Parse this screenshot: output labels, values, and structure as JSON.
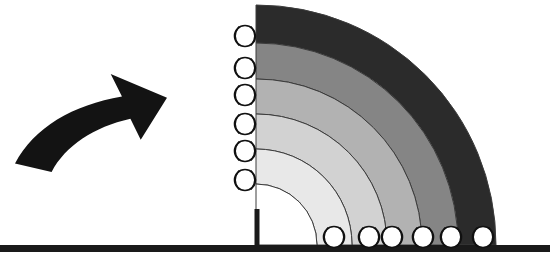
{
  "figure": {
    "title": "Baseball Range Fan Diagram",
    "background_color": "#ffffff",
    "width": 550,
    "height": 267
  },
  "ground": {
    "name": "ground-line",
    "color": "#1a1a1a",
    "x_start": 0,
    "x_end": 550,
    "y": 245,
    "thickness": 7
  },
  "home_post": {
    "name": "home-plate-post",
    "color": "#1a1a1a",
    "x": 257,
    "y_top": 209,
    "y_bottom": 245,
    "thickness": 5
  },
  "arrow": {
    "name": "curved-motion-arrow",
    "color": "#131313",
    "direction": "up-right",
    "bounds": {
      "x": 15,
      "y": 74,
      "width": 152,
      "height": 98
    }
  },
  "fan": {
    "name": "quarter-circle-range-fan",
    "origin_x": 256,
    "origin_y": 245,
    "start_angle_deg": 90,
    "sweep_deg": 90,
    "outline_color": "#3c3c3c",
    "outline_width": 1,
    "bands": [
      {
        "index": 1,
        "label": "band-1-innermost",
        "radius_inner": 0,
        "radius_outer": 61,
        "color": "#ffffff"
      },
      {
        "index": 2,
        "label": "band-2",
        "radius_inner": 61,
        "radius_outer": 96,
        "color": "#e8e8e8"
      },
      {
        "index": 3,
        "label": "band-3",
        "radius_inner": 96,
        "radius_outer": 131,
        "color": "#d2d2d2"
      },
      {
        "index": 4,
        "label": "band-4",
        "radius_inner": 131,
        "radius_outer": 166,
        "color": "#b2b2b2"
      },
      {
        "index": 5,
        "label": "band-5",
        "radius_inner": 166,
        "radius_outer": 202,
        "color": "#858585"
      },
      {
        "index": 6,
        "label": "band-6-outermost",
        "radius_inner": 202,
        "radius_outer": 240,
        "color": "#2b2b2b"
      }
    ]
  },
  "baseball_style": {
    "radius": 10.5,
    "fill": "#ffffff",
    "outline": "#111111",
    "outline_width": 1.6,
    "seam_color": "#111111",
    "seam_width": 1.4
  },
  "vertical_baseballs": {
    "name": "vertical-axis-baseball-markers",
    "count": 6,
    "x": 245,
    "positions": [
      {
        "index": 1,
        "y": 36
      },
      {
        "index": 2,
        "y": 68
      },
      {
        "index": 3,
        "y": 95
      },
      {
        "index": 4,
        "y": 124
      },
      {
        "index": 5,
        "y": 151
      },
      {
        "index": 6,
        "y": 180
      }
    ]
  },
  "ground_baseballs": {
    "name": "ground-line-baseball-markers",
    "count": 6,
    "y": 237,
    "positions": [
      {
        "index": 1,
        "x": 334
      },
      {
        "index": 2,
        "x": 369
      },
      {
        "index": 3,
        "x": 392
      },
      {
        "index": 4,
        "x": 423
      },
      {
        "index": 5,
        "x": 451
      },
      {
        "index": 6,
        "x": 483
      }
    ]
  }
}
